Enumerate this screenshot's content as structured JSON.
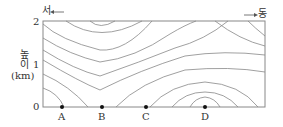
{
  "diagram": {
    "type": "contour cross-section",
    "direction": {
      "west_label": "서",
      "east_label": "동",
      "west_arrow": "←",
      "east_arrow": "→"
    },
    "y_axis": {
      "label_line1": "높",
      "label_line2": "이",
      "unit": "(km)",
      "ticks": [
        "0",
        "1",
        "2"
      ]
    },
    "points": [
      {
        "label": "A"
      },
      {
        "label": "B"
      },
      {
        "label": "C"
      },
      {
        "label": "D"
      }
    ],
    "colors": {
      "line": "#777777",
      "frame": "#888888",
      "point": "#111111",
      "text": "#333333"
    }
  }
}
